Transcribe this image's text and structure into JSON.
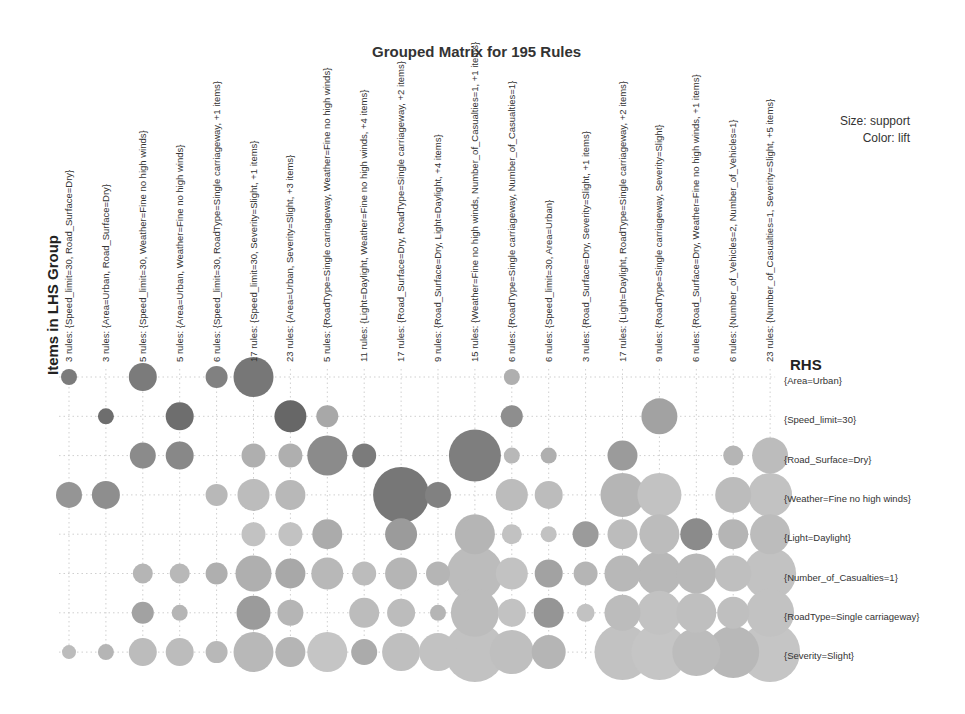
{
  "chart": {
    "title": "Grouped Matrix for 195 Rules",
    "legend": {
      "size": "Size: support",
      "color": "Color: lift"
    },
    "lhs_axis_title": "Items in LHS Group",
    "rhs_axis_title": "RHS"
  },
  "chart_data": {
    "type": "scatter",
    "subtype": "grouped-matrix-bubble",
    "title": "Grouped Matrix for 195 Rules",
    "xlabel": "Items in LHS Group",
    "ylabel": "RHS",
    "size_encoding": "support",
    "color_encoding": "lift",
    "grid": true,
    "legend_position": "top-right",
    "lhs_groups": [
      "3 rules: {Speed_limit=30, Road_Surface=Dry}",
      "3 rules: {Area=Urban, Road_Surface=Dry}",
      "5 rules: {Speed_limit=30, Weather=Fine no high winds}",
      "5 rules: {Area=Urban, Weather=Fine no high winds}",
      "6 rules: {Speed_limit=30, RoadType=Single carriageway, +1 items}",
      "17 rules: {Speed_limit=30, Severity=Slight, +1 items}",
      "23 rules: {Area=Urban, Severity=Slight, +3 items}",
      "5 rules: {RoadType=Single carriageway, Weather=Fine no high winds}",
      "11 rules: {Light=Daylight, Weather=Fine no high winds, +4 items}",
      "17 rules: {Road_Surface=Dry, RoadType=Single carriageway, +2 items}",
      "9 rules: {Road_Surface=Dry, Light=Daylight, +4 items}",
      "15 rules: {Weather=Fine no high winds, Number_of_Casualties=1, +1 items}",
      "6 rules: {RoadType=Single carriageway, Number_of_Casualties=1}",
      "6 rules: {Speed_limit=30, Area=Urban}",
      "3 rules: {Road_Surface=Dry, Severity=Slight, +1 items}",
      "17 rules: {Light=Daylight, RoadType=Single carriageway, +2 items}",
      "9 rules: {RoadType=Single carriageway, Severity=Slight}",
      "6 rules: {Road_Surface=Dry, Weather=Fine no high winds, +1 items}",
      "6 rules: {Number_of_Vehicles=2, Number_of_Vehicles=1}",
      "23 rules: {Number_of_Casualties=1, Severity=Slight, +5 items}"
    ],
    "rhs_items": [
      "{Area=Urban}",
      "{Speed_limit=30}",
      "{Road_Surface=Dry}",
      "{Weather=Fine no high winds}",
      "{Light=Daylight}",
      "{Number_of_Casualties=1}",
      "{RoadType=Single carriageway}",
      "{Severity=Slight}"
    ],
    "points_note": "Each point: [lhs_index, rhs_index, relative_support_radius_px, relative_lift_0to1] estimated from bubble size/shade",
    "points": [
      [
        0,
        0,
        8,
        0.75
      ],
      [
        2,
        0,
        14,
        0.75
      ],
      [
        4,
        0,
        11,
        0.7
      ],
      [
        5,
        0,
        20,
        0.78
      ],
      [
        12,
        0,
        8,
        0.35
      ],
      [
        1,
        1,
        8,
        0.85
      ],
      [
        3,
        1,
        14,
        0.85
      ],
      [
        6,
        1,
        16,
        0.9
      ],
      [
        7,
        1,
        11,
        0.4
      ],
      [
        12,
        1,
        11,
        0.6
      ],
      [
        16,
        1,
        18,
        0.45
      ],
      [
        2,
        2,
        13,
        0.62
      ],
      [
        3,
        2,
        14,
        0.65
      ],
      [
        5,
        2,
        12,
        0.35
      ],
      [
        6,
        2,
        12,
        0.35
      ],
      [
        7,
        2,
        20,
        0.62
      ],
      [
        8,
        2,
        12,
        0.75
      ],
      [
        11,
        2,
        26,
        0.72
      ],
      [
        12,
        2,
        8,
        0.28
      ],
      [
        13,
        2,
        8,
        0.35
      ],
      [
        15,
        2,
        15,
        0.5
      ],
      [
        18,
        2,
        10,
        0.3
      ],
      [
        19,
        2,
        18,
        0.25
      ],
      [
        0,
        3,
        13,
        0.55
      ],
      [
        1,
        3,
        14,
        0.6
      ],
      [
        4,
        3,
        11,
        0.28
      ],
      [
        5,
        3,
        16,
        0.25
      ],
      [
        6,
        3,
        15,
        0.28
      ],
      [
        9,
        3,
        28,
        0.78
      ],
      [
        10,
        3,
        13,
        0.7
      ],
      [
        12,
        3,
        16,
        0.25
      ],
      [
        13,
        3,
        14,
        0.25
      ],
      [
        15,
        3,
        22,
        0.3
      ],
      [
        16,
        3,
        22,
        0.2
      ],
      [
        18,
        3,
        18,
        0.25
      ],
      [
        19,
        3,
        22,
        0.2
      ],
      [
        5,
        4,
        12,
        0.2
      ],
      [
        6,
        4,
        12,
        0.2
      ],
      [
        7,
        4,
        15,
        0.38
      ],
      [
        9,
        4,
        16,
        0.5
      ],
      [
        11,
        4,
        20,
        0.3
      ],
      [
        12,
        4,
        10,
        0.2
      ],
      [
        13,
        4,
        8,
        0.2
      ],
      [
        14,
        4,
        13,
        0.5
      ],
      [
        15,
        4,
        15,
        0.25
      ],
      [
        16,
        4,
        20,
        0.25
      ],
      [
        17,
        4,
        16,
        0.62
      ],
      [
        18,
        4,
        15,
        0.3
      ],
      [
        19,
        4,
        20,
        0.25
      ],
      [
        2,
        5,
        10,
        0.3
      ],
      [
        3,
        5,
        10,
        0.28
      ],
      [
        4,
        5,
        11,
        0.35
      ],
      [
        5,
        5,
        18,
        0.35
      ],
      [
        6,
        5,
        15,
        0.4
      ],
      [
        7,
        5,
        16,
        0.28
      ],
      [
        8,
        5,
        12,
        0.25
      ],
      [
        9,
        5,
        16,
        0.3
      ],
      [
        10,
        5,
        12,
        0.3
      ],
      [
        11,
        5,
        28,
        0.25
      ],
      [
        12,
        5,
        16,
        0.2
      ],
      [
        13,
        5,
        14,
        0.45
      ],
      [
        14,
        5,
        12,
        0.3
      ],
      [
        15,
        5,
        18,
        0.28
      ],
      [
        16,
        5,
        22,
        0.28
      ],
      [
        17,
        5,
        20,
        0.28
      ],
      [
        18,
        5,
        18,
        0.22
      ],
      [
        19,
        5,
        26,
        0.2
      ],
      [
        2,
        6,
        11,
        0.45
      ],
      [
        3,
        6,
        8,
        0.3
      ],
      [
        5,
        6,
        17,
        0.5
      ],
      [
        6,
        6,
        13,
        0.3
      ],
      [
        8,
        6,
        15,
        0.25
      ],
      [
        9,
        6,
        14,
        0.25
      ],
      [
        10,
        6,
        8,
        0.3
      ],
      [
        11,
        6,
        24,
        0.25
      ],
      [
        12,
        6,
        14,
        0.2
      ],
      [
        13,
        6,
        15,
        0.55
      ],
      [
        14,
        6,
        9,
        0.2
      ],
      [
        15,
        6,
        18,
        0.25
      ],
      [
        16,
        6,
        22,
        0.2
      ],
      [
        17,
        6,
        20,
        0.22
      ],
      [
        18,
        6,
        16,
        0.22
      ],
      [
        19,
        6,
        24,
        0.2
      ],
      [
        0,
        7,
        7,
        0.25
      ],
      [
        1,
        7,
        8,
        0.3
      ],
      [
        2,
        7,
        14,
        0.25
      ],
      [
        3,
        7,
        14,
        0.25
      ],
      [
        4,
        7,
        11,
        0.28
      ],
      [
        5,
        7,
        20,
        0.28
      ],
      [
        6,
        7,
        15,
        0.3
      ],
      [
        7,
        7,
        20,
        0.18
      ],
      [
        8,
        7,
        13,
        0.38
      ],
      [
        9,
        7,
        19,
        0.22
      ],
      [
        10,
        7,
        19,
        0.2
      ],
      [
        11,
        7,
        30,
        0.2
      ],
      [
        12,
        7,
        22,
        0.22
      ],
      [
        13,
        7,
        17,
        0.3
      ],
      [
        15,
        7,
        28,
        0.2
      ],
      [
        16,
        7,
        28,
        0.18
      ],
      [
        17,
        7,
        24,
        0.25
      ],
      [
        18,
        7,
        26,
        0.28
      ],
      [
        19,
        7,
        30,
        0.18
      ]
    ]
  }
}
